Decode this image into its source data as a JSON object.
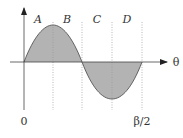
{
  "diagram": {
    "type": "sine-wave-regions",
    "x_axis_label": "θ",
    "origin_label": "0",
    "end_label": "β/2",
    "regions": [
      {
        "label": "A"
      },
      {
        "label": "B"
      },
      {
        "label": "C"
      },
      {
        "label": "D"
      }
    ],
    "colors": {
      "fill": "#b3b3b3",
      "curve": "#555555",
      "axis": "#444444",
      "divider": "#999999"
    }
  }
}
